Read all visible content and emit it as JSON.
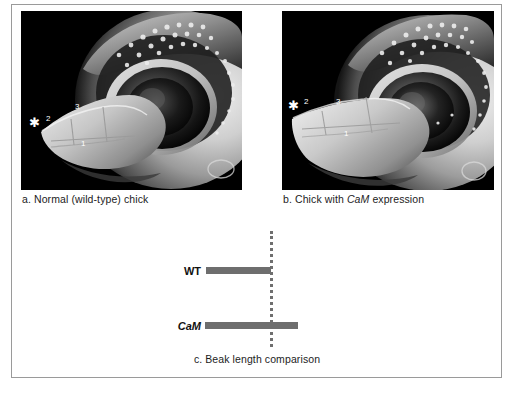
{
  "figure": {
    "panels": [
      {
        "id": "panel-a",
        "caption_prefix": "a. Normal (wild-type) chick",
        "caption_label": "a.",
        "caption_text": "Normal (wild-type) chick",
        "image_alt": "scanning-electron-micrograph-wild-type-chick-embryo-head",
        "annotations": [
          {
            "name": "asterisk-marker",
            "symbol": "✱"
          },
          {
            "name": "marker-2",
            "symbol": "2"
          },
          {
            "name": "marker-3",
            "symbol": "3"
          },
          {
            "name": "marker-1",
            "symbol": "1"
          }
        ]
      },
      {
        "id": "panel-b",
        "caption_prefix": "b. Chick with CaM expression",
        "caption_label": "b.",
        "caption_text_pre": "Chick with ",
        "caption_text_italic": "CaM",
        "caption_text_post": " expression",
        "image_alt": "scanning-electron-micrograph-chick-embryo-head-with-CaM-expression",
        "annotations": [
          {
            "name": "asterisk-marker",
            "symbol": "✱"
          },
          {
            "name": "marker-2",
            "symbol": "2"
          },
          {
            "name": "marker-3",
            "symbol": "3"
          },
          {
            "name": "marker-1",
            "symbol": "1"
          }
        ]
      }
    ],
    "chart_caption_label": "c.",
    "chart_caption_text": "Beak length comparison",
    "chart_caption_full": "c. Beak length comparison"
  },
  "chart_data": {
    "type": "bar",
    "orientation": "horizontal",
    "title": "c. Beak length comparison",
    "categories": [
      "WT",
      "CaM"
    ],
    "category_labels_styled": [
      {
        "text": "WT",
        "italic": false
      },
      {
        "text": "CaM",
        "italic": true
      }
    ],
    "values": [
      65,
      93
    ],
    "units": "relative beak length (px)",
    "xlabel": "",
    "ylabel": "",
    "xlim": [
      0,
      100
    ],
    "grid": false,
    "legend": false,
    "bar_color": "#6e6e6e",
    "reference_line": {
      "name": "wild-type-reference",
      "value": 65,
      "style": "dotted",
      "color": "#6f6f6f"
    },
    "annotation": "CaM bar extends past the dotted wild-type reference line, indicating a longer beak."
  },
  "colors": {
    "frame_border": "#9a9a9a",
    "background": "#ffffff",
    "bar": "#6e6e6e",
    "reference_line": "#6f6f6f",
    "micrograph_background": "#000000",
    "caption_text": "#1c1c1c"
  }
}
